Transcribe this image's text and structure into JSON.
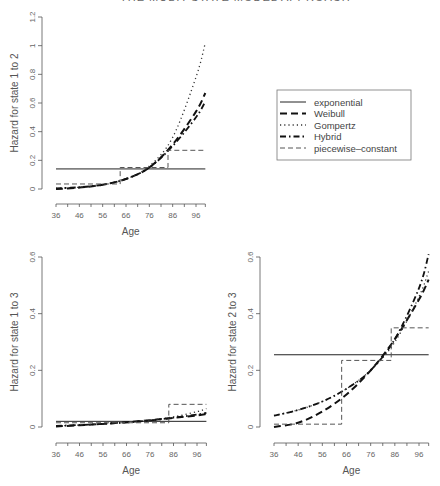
{
  "header": {
    "text": "THE MULTI-STATE MODEL APPROACH"
  },
  "legend": {
    "entries": [
      {
        "label": "exponential",
        "style": "solid"
      },
      {
        "label": "Weibull",
        "style": "dashed-bold"
      },
      {
        "label": "Gompertz",
        "style": "dotted"
      },
      {
        "label": "Hybrid",
        "style": "dashdot"
      },
      {
        "label": "piecewise–constant",
        "style": "dashed-thin"
      }
    ]
  },
  "chart_data": [
    {
      "type": "line",
      "title": "",
      "xlabel": "Age",
      "ylabel": "Hazard for state 1 to 2",
      "xlim": [
        36,
        100
      ],
      "ylim": [
        0,
        1.2
      ],
      "xticks": [
        36,
        46,
        56,
        66,
        76,
        86,
        96
      ],
      "yticks": [
        0,
        0.2,
        0.4,
        0.6,
        0.8,
        1,
        1.2
      ],
      "ytick_labels": [
        "0",
        "0.2",
        "0.4",
        "0.6",
        "0.8",
        "1",
        "1.2"
      ],
      "series": [
        {
          "name": "exponential",
          "x": [
            36,
            100
          ],
          "values": [
            0.14,
            0.14
          ]
        },
        {
          "name": "Weibull",
          "x": [
            36,
            46,
            56,
            66,
            76,
            86,
            96,
            100
          ],
          "values": [
            0.0,
            0.01,
            0.03,
            0.07,
            0.15,
            0.31,
            0.54,
            0.67
          ]
        },
        {
          "name": "Gompertz",
          "x": [
            36,
            46,
            56,
            66,
            76,
            86,
            96,
            100
          ],
          "values": [
            0.005,
            0.012,
            0.03,
            0.07,
            0.16,
            0.36,
            0.78,
            1.02
          ]
        },
        {
          "name": "Hybrid",
          "x": [
            36,
            46,
            56,
            66,
            76,
            86,
            96,
            100
          ],
          "values": [
            0.005,
            0.012,
            0.03,
            0.07,
            0.15,
            0.3,
            0.5,
            0.61
          ]
        },
        {
          "name": "piecewise-constant",
          "x": [
            36,
            63.5,
            63.5,
            84,
            84,
            100
          ],
          "values": [
            0.035,
            0.035,
            0.15,
            0.15,
            0.27,
            0.27
          ]
        }
      ]
    },
    {
      "type": "line",
      "title": "",
      "xlabel": "Age",
      "ylabel": "Hazard for state 1 to 3",
      "xlim": [
        36,
        100
      ],
      "ylim": [
        0,
        0.6
      ],
      "xticks": [
        36,
        46,
        56,
        66,
        76,
        86,
        96
      ],
      "yticks": [
        0,
        0.2,
        0.4,
        0.6
      ],
      "ytick_labels": [
        "0",
        "0.2",
        "0.4",
        "0.6"
      ],
      "series": [
        {
          "name": "exponential",
          "x": [
            36,
            100
          ],
          "values": [
            0.02,
            0.02
          ]
        },
        {
          "name": "Weibull",
          "x": [
            36,
            46,
            56,
            66,
            76,
            86,
            96,
            100
          ],
          "values": [
            0.002,
            0.006,
            0.011,
            0.017,
            0.024,
            0.032,
            0.041,
            0.046
          ]
        },
        {
          "name": "Gompertz",
          "x": [
            36,
            46,
            56,
            66,
            76,
            86,
            96,
            100
          ],
          "values": [
            0.004,
            0.007,
            0.011,
            0.016,
            0.024,
            0.036,
            0.054,
            0.065
          ]
        },
        {
          "name": "Hybrid",
          "x": [
            36,
            46,
            56,
            66,
            76,
            86,
            96,
            100
          ],
          "values": [
            0.004,
            0.007,
            0.011,
            0.016,
            0.023,
            0.033,
            0.044,
            0.05
          ]
        },
        {
          "name": "piecewise-constant",
          "x": [
            36,
            84,
            84,
            100
          ],
          "values": [
            0.015,
            0.015,
            0.08,
            0.08
          ]
        }
      ]
    },
    {
      "type": "line",
      "title": "",
      "xlabel": "Age",
      "ylabel": "Hazard for state 2 to 3",
      "xlim": [
        36,
        100
      ],
      "ylim": [
        0,
        0.6
      ],
      "xticks": [
        36,
        46,
        56,
        66,
        76,
        86,
        96
      ],
      "yticks": [
        0,
        0.2,
        0.4,
        0.6
      ],
      "ytick_labels": [
        "0",
        "0.2",
        "0.4",
        "0.6"
      ],
      "series": [
        {
          "name": "exponential",
          "x": [
            36,
            100
          ],
          "values": [
            0.255,
            0.255
          ]
        },
        {
          "name": "Weibull",
          "x": [
            36,
            46,
            56,
            66,
            76,
            86,
            96,
            100
          ],
          "values": [
            0.0,
            0.015,
            0.055,
            0.115,
            0.2,
            0.31,
            0.45,
            0.52
          ]
        },
        {
          "name": "Gompertz",
          "x": [
            36,
            46,
            56,
            66,
            76,
            86,
            96,
            100
          ],
          "values": [
            0.04,
            0.06,
            0.09,
            0.135,
            0.2,
            0.3,
            0.46,
            0.55
          ]
        },
        {
          "name": "Hybrid",
          "x": [
            36,
            46,
            56,
            66,
            76,
            86,
            96,
            100
          ],
          "values": [
            0.04,
            0.06,
            0.09,
            0.135,
            0.2,
            0.31,
            0.49,
            0.61
          ]
        },
        {
          "name": "piecewise-constant",
          "x": [
            36,
            64,
            64,
            84.5,
            84.5,
            100
          ],
          "values": [
            0.01,
            0.01,
            0.235,
            0.235,
            0.35,
            0.35
          ]
        }
      ]
    }
  ]
}
